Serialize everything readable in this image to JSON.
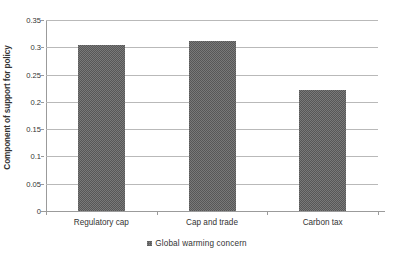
{
  "chart_data": {
    "type": "bar",
    "title": "",
    "subtitle": "",
    "xlabel": "",
    "ylabel": "Component of support for policy",
    "categories": [
      "Regulatory cap",
      "Cap and trade",
      "Carbon tax"
    ],
    "series": [
      {
        "name": "Global warming concern",
        "values": [
          0.305,
          0.311,
          0.222
        ],
        "color": "#616161"
      }
    ],
    "values": [
      0.305,
      0.311,
      0.222
    ],
    "ylim": [
      0,
      0.35
    ],
    "ytick_values": [
      0,
      0.05,
      0.1,
      0.15,
      0.2,
      0.25,
      0.3,
      0.35
    ],
    "ytick_labels": [
      "0",
      "0.05",
      "0.1",
      "0.15",
      "0.2",
      "0.25",
      "0.3",
      "0.35"
    ],
    "grid": "horizontal",
    "legend_position": "bottom-center",
    "legend_entries": [
      "Global warming concern"
    ],
    "annotations": []
  },
  "colors": {
    "bar_fill": "#616161",
    "gridline": "#b9b9b9",
    "axis": "#9b9b9b",
    "text": "#333333",
    "background": "#ffffff"
  }
}
